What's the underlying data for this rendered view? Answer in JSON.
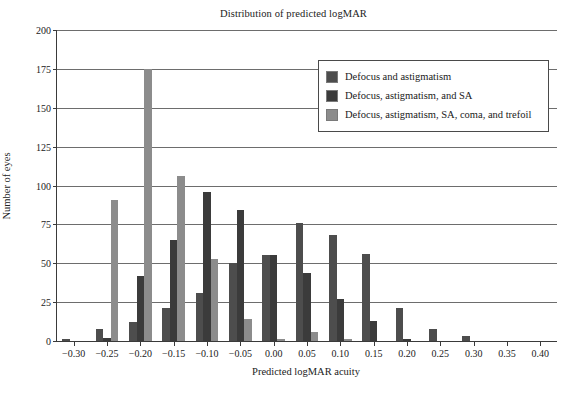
{
  "chart_data": {
    "type": "bar",
    "title": "Distribution of predicted logMAR",
    "xlabel": "Predicted logMAR acuity",
    "ylabel": "Number of eyes",
    "xlim": [
      -0.325,
      0.425
    ],
    "ylim": [
      0,
      200
    ],
    "ytick_values": [
      0,
      25,
      50,
      75,
      100,
      125,
      150,
      175,
      200
    ],
    "ytick_labels": [
      "0",
      "25",
      "50",
      "75",
      "100",
      "125",
      "150",
      "175",
      "200"
    ],
    "xtick_values": [
      -0.3,
      -0.25,
      -0.2,
      -0.15,
      -0.1,
      -0.05,
      0.0,
      0.05,
      0.1,
      0.15,
      0.2,
      0.25,
      0.3,
      0.35,
      0.4
    ],
    "xtick_labels": [
      "−0.30",
      "−0.25",
      "−0.20",
      "−0.15",
      "−0.10",
      "−0.05",
      "0.00",
      "0.05",
      "0.10",
      "0.15",
      "0.20",
      "0.25",
      "0.30",
      "0.35",
      "0.40"
    ],
    "grid": "horizontal",
    "legend_position": "top-right",
    "categories": [
      -0.3,
      -0.25,
      -0.2,
      -0.15,
      -0.1,
      -0.05,
      0.0,
      0.05,
      0.1,
      0.15,
      0.2,
      0.25,
      0.3,
      0.35
    ],
    "series": [
      {
        "name": "Defocus and astigmatism",
        "color": "#4d4d4d",
        "values": [
          1,
          8,
          12,
          21,
          31,
          50,
          55,
          76,
          68,
          56,
          21,
          8,
          3,
          0
        ]
      },
      {
        "name": "Defocus, astigmatism, and SA",
        "color": "#3b3b3b",
        "values": [
          0,
          2,
          42,
          65,
          96,
          84,
          55,
          44,
          27,
          13,
          1,
          0,
          0,
          0
        ]
      },
      {
        "name": "Defocus, astigmatism, SA, coma, and trefoil",
        "color": "#8c8c8c",
        "values": [
          0,
          91,
          175,
          106,
          53,
          14,
          1,
          6,
          1,
          0,
          0,
          0,
          0,
          0
        ]
      }
    ]
  }
}
